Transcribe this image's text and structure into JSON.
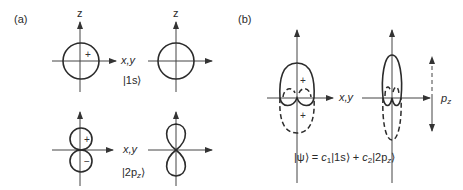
{
  "panels": {
    "a": {
      "label": "(a)",
      "axis_vertical_label": "z",
      "axis_horizontal_label": "x,y",
      "rows": [
        {
          "state_label": "|1s⟩",
          "signs": [
            "+"
          ],
          "shape": "circle"
        },
        {
          "state_label": "|2p₂⟩",
          "state_main": "|2p",
          "state_sub": "z",
          "state_close": "⟩",
          "signs": [
            "+",
            "−"
          ],
          "shape": "figure-eight"
        }
      ]
    },
    "b": {
      "label": "(b)",
      "axis_horizontal_label": "x,y",
      "signs": [
        "+",
        "+"
      ],
      "dipole_label_main": "p",
      "dipole_label_sub": "z",
      "equation": {
        "ket_psi": "|ψ⟩ = ",
        "c1": "c",
        "c1_sub": "1",
        "term1": "|1s⟩ + ",
        "c2": "c",
        "c2_sub": "2",
        "term2": "|2p",
        "term2_sub": "z",
        "term2_close": "⟩"
      }
    }
  },
  "colors": {
    "line": "#2b2b2b",
    "text": "#2a2a2a",
    "background": "#ffffff"
  }
}
